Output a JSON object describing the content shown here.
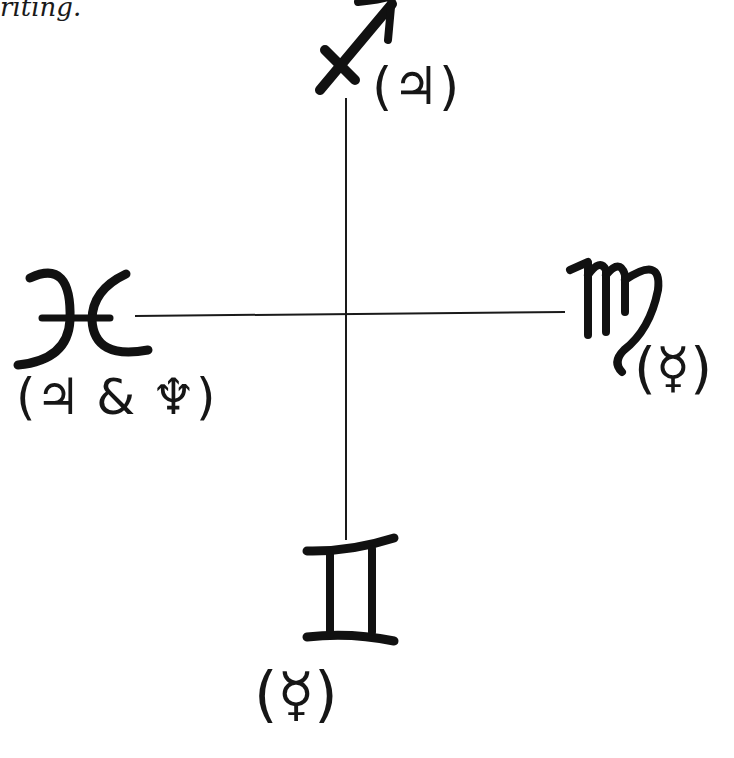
{
  "text_fragment": "riting.",
  "diagram": {
    "type": "cross",
    "center": {
      "x": 346,
      "y": 314
    },
    "line_color": "#1a1a1a",
    "signs": {
      "top": {
        "name": "Sagittarius",
        "glyph": "♐",
        "rulers_label": "(♃)",
        "rulers": [
          "Jupiter"
        ]
      },
      "left": {
        "name": "Pisces",
        "glyph": "♓",
        "rulers_label": "(♃ & ♆)",
        "rulers": [
          "Jupiter",
          "Neptune"
        ]
      },
      "right": {
        "name": "Virgo",
        "glyph": "♍",
        "rulers_label": "(☿)",
        "rulers": [
          "Mercury"
        ]
      },
      "bottom": {
        "name": "Gemini",
        "glyph": "♊",
        "rulers_label": "(☿)",
        "rulers": [
          "Mercury"
        ]
      }
    }
  }
}
